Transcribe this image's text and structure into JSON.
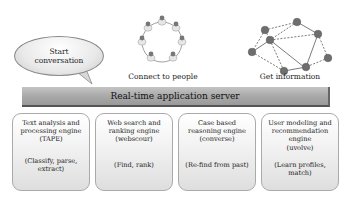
{
  "bubble": {
    "text_line1": "Start",
    "text_line2": "conversation"
  },
  "people_ring": {
    "caption": "Connect to people",
    "count": 8
  },
  "network": {
    "caption": "Get information"
  },
  "server": {
    "label": "Real-time application server"
  },
  "engines": [
    {
      "title_lines": [
        "Text analysis and",
        "processing engine",
        "(TAPE)"
      ],
      "sub_lines": [
        "(Classify, parse,",
        "extract)"
      ]
    },
    {
      "title_lines": [
        "Web search and",
        "ranking engine",
        "(webscour)"
      ],
      "sub_lines": [
        "(Find, rank)"
      ]
    },
    {
      "title_lines": [
        "Case based",
        "reasoning engine",
        "(converse)"
      ],
      "sub_lines": [
        "(Re-find from past)"
      ]
    },
    {
      "title_lines": [
        "User modeling and",
        "recommendation",
        "engine",
        "(uvolve)"
      ],
      "sub_lines": [
        "(Learn profiles,",
        "match)"
      ]
    }
  ],
  "colors": {
    "server_bar": "#a9a9a9",
    "node": "#6e6e6e",
    "box_border": "#aaaaaa"
  }
}
